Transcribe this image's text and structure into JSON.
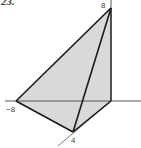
{
  "problem": {
    "number": "23."
  },
  "diagram": {
    "type": "tetrahedron-in-3d-axes",
    "fill_color": "#d9d9d9",
    "edge_color": "#1a1a1a",
    "axis_color": "#555555",
    "labels": {
      "z_intercept": "8",
      "x_intercept": "−8",
      "y_intercept": "4"
    }
  }
}
